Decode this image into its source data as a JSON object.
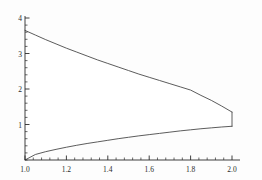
{
  "chart_data": {
    "type": "area",
    "title": "",
    "xlabel": "",
    "ylabel": "",
    "xlim": [
      1.0,
      2.0
    ],
    "ylim": [
      0,
      4
    ],
    "grid": false,
    "legend": null,
    "background_color": "#fdfdfd",
    "curve_color": "#4a4a4a",
    "axis_color": "#2b2b2b",
    "fill_color": "#ffffff",
    "x_ticks_major": [
      1.0,
      1.2,
      1.4,
      1.6,
      1.8,
      2.0
    ],
    "x_tick_labels": [
      "1.0",
      "1.2",
      "1.4",
      "1.6",
      "1.8",
      "2.0"
    ],
    "x_minor_per_major": 5,
    "y_ticks_major": [
      1,
      2,
      3,
      4
    ],
    "y_tick_labels": [
      "1",
      "2",
      "3",
      "4"
    ],
    "y_minor_per_major": 5,
    "series": [
      {
        "name": "upper-curve",
        "x": [
          1.0,
          1.05,
          1.1,
          1.15,
          1.2,
          1.25,
          1.3,
          1.35,
          1.4,
          1.45,
          1.5,
          1.55,
          1.6,
          1.65,
          1.7,
          1.75,
          1.8,
          1.85,
          1.9,
          1.95,
          2.0
        ],
        "values": [
          3.65,
          3.52,
          3.39,
          3.27,
          3.15,
          3.04,
          2.93,
          2.82,
          2.72,
          2.62,
          2.52,
          2.42,
          2.33,
          2.24,
          2.15,
          2.06,
          1.97,
          1.82,
          1.68,
          1.52,
          1.35
        ]
      },
      {
        "name": "lower-curve",
        "x": [
          1.0,
          1.05,
          1.1,
          1.15,
          1.2,
          1.25,
          1.3,
          1.35,
          1.4,
          1.45,
          1.5,
          1.55,
          1.6,
          1.65,
          1.7,
          1.75,
          1.8,
          1.85,
          1.9,
          1.95,
          2.0
        ],
        "values": [
          0.0,
          0.155,
          0.235,
          0.3,
          0.36,
          0.415,
          0.465,
          0.51,
          0.555,
          0.6,
          0.64,
          0.68,
          0.715,
          0.75,
          0.785,
          0.82,
          0.85,
          0.88,
          0.905,
          0.93,
          0.95
        ]
      },
      {
        "name": "right-closing-segment",
        "x": [
          2.0,
          2.0
        ],
        "values": [
          0.95,
          1.35
        ]
      }
    ]
  }
}
